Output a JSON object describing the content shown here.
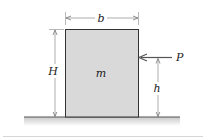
{
  "diagram": {
    "type": "statics-block-tipping",
    "labels": {
      "width": "b",
      "height": "H",
      "mass": "m",
      "force": "P",
      "force_height": "h"
    },
    "colors": {
      "block_fill": "#d9d9d9",
      "block_stroke": "#333333",
      "ground_stroke": "#555555",
      "ground_shade": "#cfcfcf",
      "dimension_stroke": "#777777",
      "separator": "#cccccc"
    }
  }
}
